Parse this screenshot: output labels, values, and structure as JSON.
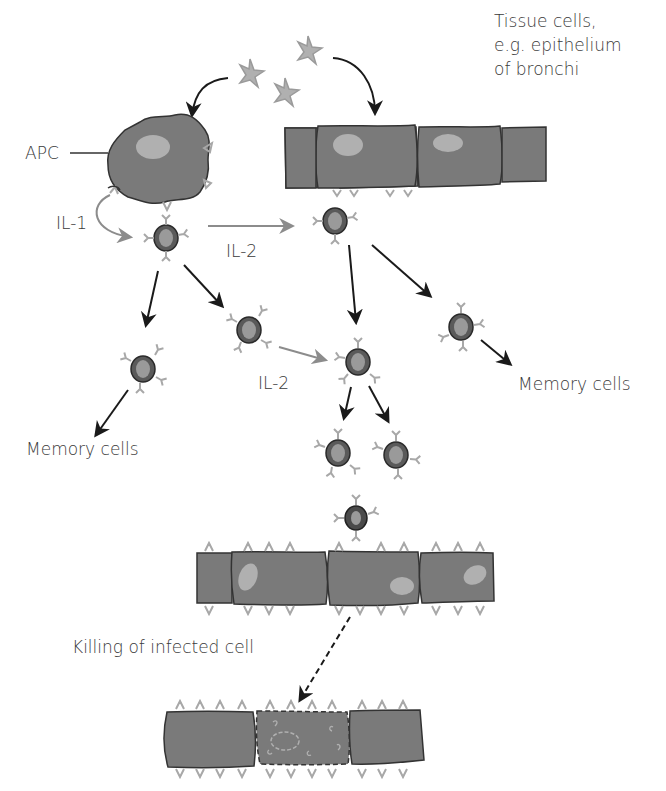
{
  "diagram": {
    "title_block": {
      "line1": "Tissue cells,",
      "line2": "e.g. epithelium",
      "line3": "of bronchi"
    },
    "labels": {
      "apc": "APC",
      "il1": "IL-1",
      "il2_top": "IL-2",
      "il2_mid": "IL-2",
      "memory_left": "Memory cells",
      "memory_right": "Memory cells",
      "killing": "Killing of infected cell"
    },
    "colors": {
      "cell_fill": "#7a7a7a",
      "cell_outline": "#333333",
      "nucleus": "#b0b0b0",
      "tcell_outer": "#5a5a5a",
      "tcell_inner": "#9a9a9a",
      "receptor": "#a8a8a8",
      "arrow_black": "#1a1a1a",
      "arrow_grey": "#8c8c8c",
      "text": "#3a3a3a"
    }
  }
}
